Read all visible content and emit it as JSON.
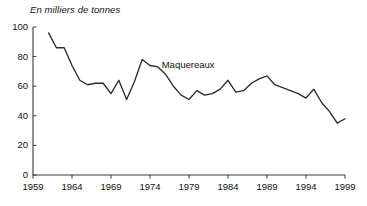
{
  "chart_data": {
    "type": "line",
    "title": "En milliers de tonnes",
    "xlabel": "",
    "ylabel": "",
    "ylim": [
      0,
      100
    ],
    "xlim": [
      1959,
      1999
    ],
    "grid": false,
    "legend_position": "inline-annotation",
    "y_ticks": [
      0,
      20,
      40,
      60,
      80,
      100
    ],
    "y_tick_labels": [
      "0",
      "20",
      "40",
      "60",
      "80",
      "100"
    ],
    "x_ticks": [
      1959,
      1964,
      1969,
      1974,
      1979,
      1984,
      1989,
      1994,
      1999
    ],
    "x_tick_labels": [
      "1959",
      "1964",
      "1969",
      "1974",
      "1979",
      "1984",
      "1989",
      "1994",
      "1999"
    ],
    "annotations": [
      {
        "text": "Maquereaux",
        "x": 1975.5,
        "y": 74
      }
    ],
    "series": [
      {
        "name": "Maquereaux",
        "color": "#2b2b2b",
        "x": [
          1961,
          1962,
          1963,
          1964,
          1965,
          1966,
          1967,
          1968,
          1969,
          1970,
          1971,
          1972,
          1973,
          1974,
          1975,
          1976,
          1977,
          1978,
          1979,
          1980,
          1981,
          1982,
          1983,
          1984,
          1985,
          1986,
          1987,
          1988,
          1989,
          1990,
          1991,
          1992,
          1993,
          1994,
          1995,
          1996,
          1997,
          1998,
          1999
        ],
        "values": [
          96,
          86,
          86,
          74,
          64,
          61,
          62,
          62,
          55,
          64,
          51,
          63,
          78,
          74,
          73,
          68,
          60,
          54,
          51,
          57,
          54,
          55,
          58,
          64,
          56,
          57,
          62,
          65,
          67,
          61,
          59,
          57,
          55,
          52,
          58,
          49,
          43,
          35,
          38
        ]
      }
    ]
  },
  "plot_geometry": {
    "left": 33,
    "right": 345,
    "top": 27,
    "bottom": 175
  }
}
